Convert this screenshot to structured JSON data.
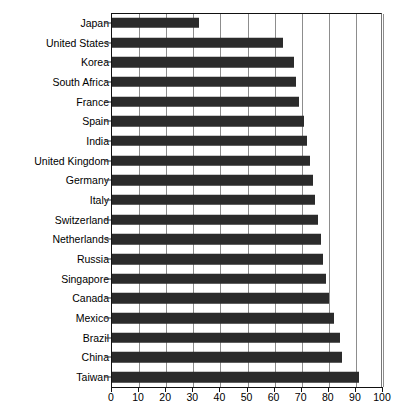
{
  "chart_data": {
    "type": "bar",
    "orientation": "horizontal",
    "title": "",
    "xlabel": "",
    "ylabel": "",
    "xlim": [
      0,
      100
    ],
    "xticks": [
      0,
      10,
      20,
      30,
      40,
      50,
      60,
      70,
      80,
      90,
      100
    ],
    "grid": true,
    "legend": null,
    "bar_color": "#2b2b2b",
    "categories": [
      "Japan",
      "United States",
      "Korea",
      "South Africa",
      "France",
      "Spain",
      "India",
      "United Kingdom",
      "Germany",
      "Italy",
      "Switzerland",
      "Netherlands",
      "Russia",
      "Singapore",
      "Canada",
      "Mexico",
      "Brazil",
      "China",
      "Taiwan"
    ],
    "values": [
      32,
      63,
      67,
      68,
      69,
      71,
      72,
      73,
      74,
      75,
      76,
      77,
      78,
      79,
      80,
      82,
      84,
      85,
      91
    ]
  },
  "axis": {
    "tick_labels": [
      "0",
      "10",
      "20",
      "30",
      "40",
      "50",
      "60",
      "70",
      "80",
      "90",
      "100"
    ]
  }
}
